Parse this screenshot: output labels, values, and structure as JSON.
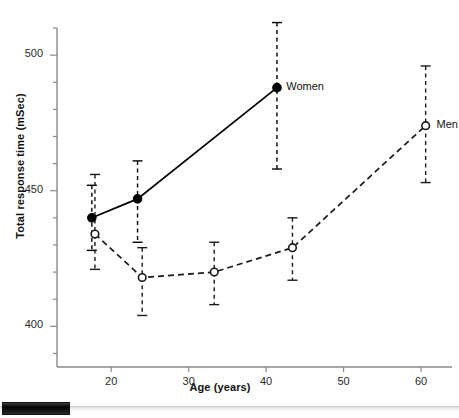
{
  "chart_data": {
    "type": "line",
    "title": "",
    "xlabel": "Age (years)",
    "ylabel": "Total response time (mSec)",
    "xlim": [
      13,
      64
    ],
    "ylim": [
      385,
      510
    ],
    "grid": false,
    "legend_position": "inline-right-of-last-point",
    "x_major_ticks": [
      20,
      30,
      40,
      50,
      60
    ],
    "x_tick_labels": [
      "20",
      "30",
      "40",
      "50",
      "60"
    ],
    "y_major_ticks": [
      400,
      450,
      500
    ],
    "y_tick_labels": [
      "400",
      "450",
      "500"
    ],
    "y_minor_tick_step": 10,
    "error_bar_style": "dashed vertical with T caps",
    "series": [
      {
        "name": "Women",
        "marker": "filled-circle",
        "line_style": "solid",
        "color": "#000000",
        "x": [
          17.5,
          23.4,
          41.4
        ],
        "values": [
          440,
          447,
          488
        ],
        "err_low": [
          428,
          431,
          458
        ],
        "err_high": [
          452,
          461,
          512
        ]
      },
      {
        "name": "Men",
        "marker": "open-circle",
        "line_style": "dashed",
        "color": "#1a1a1a",
        "x": [
          17.9,
          24.0,
          33.3,
          43.4,
          60.6
        ],
        "values": [
          434,
          418,
          420,
          429,
          474
        ],
        "err_low": [
          421,
          404,
          408,
          417,
          453
        ],
        "err_high": [
          456,
          429,
          431,
          440,
          496
        ]
      }
    ],
    "annotations": [
      {
        "text": "Women",
        "x": 42.6,
        "y": 488
      },
      {
        "text": "Men",
        "x": 62.0,
        "y": 474
      }
    ]
  },
  "scrollbar": {
    "orientation": "horizontal",
    "thumb_position": "left"
  }
}
